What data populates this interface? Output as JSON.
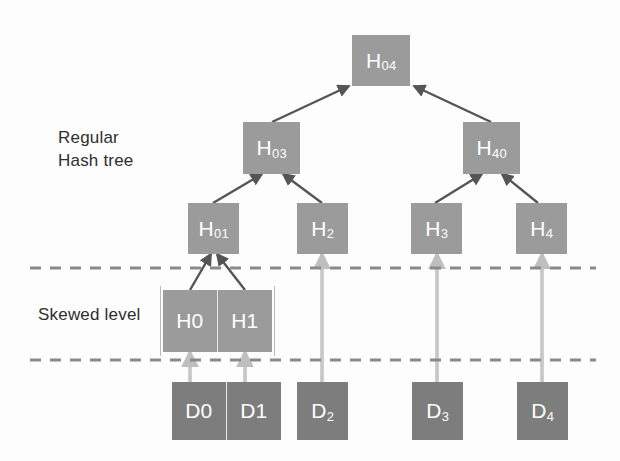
{
  "figure": {
    "background_color": "#fdfdfd"
  },
  "labels": {
    "regular_hash_tree": "Regular\nHash tree",
    "skewed_level": "Skewed level"
  },
  "colors": {
    "hash_node_fill": "#9b9b9b",
    "data_node_fill": "#7d7d7d",
    "node_text": "#ffffff",
    "tree_edge": "#555555",
    "data_edge": "#bfbfbf",
    "dashed_line": "#8a8a8a",
    "label_text": "#2e2e2e"
  },
  "nodes": {
    "root": {
      "base": "H",
      "sub": "04",
      "name": "H04"
    },
    "level2": [
      {
        "base": "H",
        "sub": "03",
        "name": "H03"
      },
      {
        "base": "H",
        "sub": "40",
        "name": "H40"
      }
    ],
    "level3": [
      {
        "base": "H",
        "sub": "01",
        "name": "H01"
      },
      {
        "base": "H",
        "sub": "2",
        "name": "H2"
      },
      {
        "base": "H",
        "sub": "3",
        "name": "H3"
      },
      {
        "base": "H",
        "sub": "4",
        "name": "H4"
      }
    ],
    "skewed": [
      {
        "base": "H",
        "sub": "0",
        "name": "H0"
      },
      {
        "base": "H",
        "sub": "1",
        "name": "H1"
      }
    ],
    "data": [
      {
        "base": "D",
        "sub": "0",
        "name": "D0"
      },
      {
        "base": "D",
        "sub": "1",
        "name": "D1"
      },
      {
        "base": "D",
        "sub": "2",
        "name": "D2"
      },
      {
        "base": "D",
        "sub": "3",
        "name": "D3"
      },
      {
        "base": "D",
        "sub": "4",
        "name": "D4"
      }
    ]
  },
  "separators": [
    {
      "name": "upper-skewed-boundary",
      "y": 268
    },
    {
      "name": "lower-skewed-boundary",
      "y": 360
    }
  ]
}
